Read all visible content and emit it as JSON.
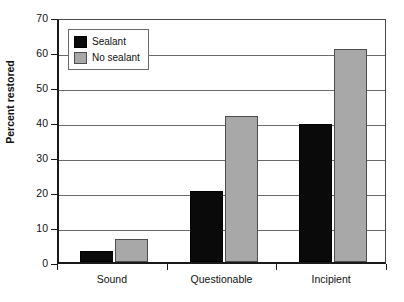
{
  "chart_data": {
    "type": "bar",
    "title": "",
    "xlabel": "",
    "ylabel": "Percent restored",
    "categories": [
      "Sound",
      "Questionable",
      "Incipient"
    ],
    "series": [
      {
        "name": "Sealant",
        "color": "#0a0a0a",
        "values": [
          3.2,
          20.2,
          39.5
        ]
      },
      {
        "name": "No sealant",
        "color": "#a8a8a8",
        "values": [
          6.5,
          41.7,
          60.8
        ]
      }
    ],
    "ylim": [
      0,
      70
    ],
    "ytick_values": [
      0,
      10,
      20,
      30,
      40,
      50,
      60,
      70
    ],
    "ytick_labels": [
      "0",
      "10",
      "20",
      "30",
      "40",
      "50",
      "60",
      "70"
    ],
    "grid": true,
    "legend_position": "upper left"
  }
}
